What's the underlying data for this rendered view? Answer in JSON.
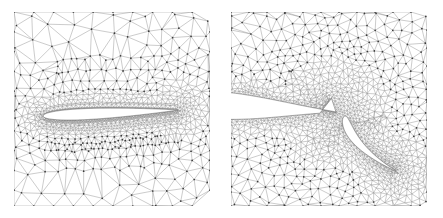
{
  "figure": {
    "title": "",
    "caption": "",
    "background_color": "#ffffff",
    "width": 443,
    "height": 218
  },
  "style": {
    "mesh_line_color": "#8d8d8d",
    "node_color": "#3a3a3a",
    "body_outline_color": "#5a5a5a",
    "body_fill_color": "#ffffff"
  },
  "panels": [
    {
      "id": "left-panel",
      "name": "airfoil-global-mesh",
      "label": "",
      "x": 14,
      "y": 12,
      "width": 196,
      "height": 194,
      "description": "Unstructured triangular mesh around a full single-element airfoil, global view",
      "geometry": {
        "type": "airfoil",
        "chord_start": [
          43,
          116
        ],
        "chord_end": [
          178,
          110
        ],
        "max_thickness": 11,
        "angle_of_attack_deg": -2
      },
      "mesh": {
        "type": "unstructured-triangular",
        "farfield_spacing": 22,
        "wall_spacing": 1.1,
        "boundary_layer_rings": 14,
        "wake_refinement": true
      }
    },
    {
      "id": "right-panel",
      "name": "flap-closeup-mesh",
      "label": "",
      "x": 231,
      "y": 12,
      "width": 196,
      "height": 194,
      "description": "Close-up of the trailing edge region showing the deployed flap and cove mesh refinement",
      "geometry": {
        "type": "two-element-airfoil",
        "main_element": {
          "leading_edge": [
            228,
            104
          ],
          "trailing_edge": [
            336,
            112
          ],
          "max_thickness": 16
        },
        "flap": {
          "leading_edge": [
            345,
            116
          ],
          "trailing_edge": [
            396,
            171
          ],
          "max_thickness": 7,
          "deflection_deg": 42
        },
        "gap_node_cluster": [
          334,
          112
        ]
      },
      "mesh": {
        "type": "unstructured-triangular",
        "farfield_spacing": 20,
        "wall_spacing": 0.8,
        "boundary_layer_rings": 16,
        "cove_refinement": true,
        "wake_refinement": true
      }
    }
  ]
}
